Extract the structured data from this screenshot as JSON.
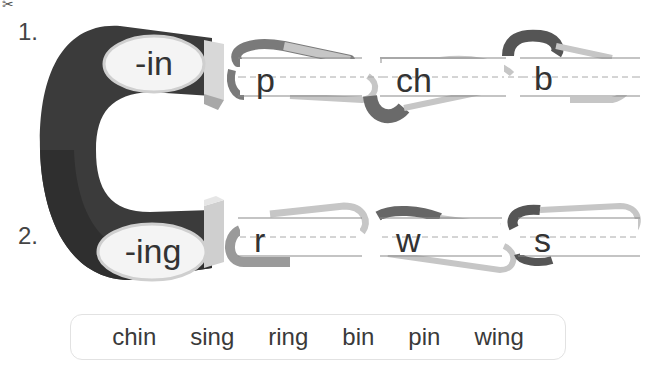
{
  "worksheet": {
    "scissors_icon": "✂",
    "rows": [
      {
        "number": "1.",
        "ending": "-in",
        "starts": [
          "p",
          "ch",
          "b"
        ]
      },
      {
        "number": "2.",
        "ending": "-ing",
        "starts": [
          "r",
          "w",
          "s"
        ]
      }
    ],
    "word_bank": [
      "chin",
      "sing",
      "ring",
      "bin",
      "pin",
      "wing"
    ]
  },
  "colors": {
    "magnet_dark": "#3a3a3a",
    "magnet_tip": "#d6d6d6",
    "clip_light": "#c4c4c4",
    "clip_dark": "#6e6e6e",
    "guide_line": "#8a8a8a"
  }
}
